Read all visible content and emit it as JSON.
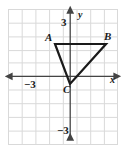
{
  "figure": {
    "type": "coordinate-grid-triangle",
    "background_color": "#ffffff",
    "grid_color": "#d9d9d9",
    "axis_color": "#555555",
    "shape_color": "#1a1a1a"
  },
  "axes": {
    "x_axis_label": "x",
    "y_axis_label": "y",
    "x_tick_label": "−3",
    "y_tick_label_positive": "3",
    "y_tick_label_negative": "−3",
    "x_range": [
      -4.8,
      3.7
    ],
    "y_range": [
      -5.3,
      5.2
    ],
    "grid_spacing": 1,
    "x_axis_pixel_y": 76,
    "y_axis_pixel_x": 70,
    "pixel_per_unit": 13.7
  },
  "triangle": {
    "vertices": [
      {
        "name": "A",
        "x": -1.1,
        "y": 2.35
      },
      {
        "name": "B",
        "x": 2.65,
        "y": 2.35
      },
      {
        "name": "C",
        "x": 0.0,
        "y": -0.6
      }
    ],
    "label_A": "A",
    "label_B": "B",
    "label_C": "C",
    "stroke_width": 2.2
  },
  "grid": {
    "left": 8,
    "top": 9,
    "right": 118,
    "bottom": 145,
    "cell_size": 13.7,
    "vertical_lines": [
      8,
      21.7,
      35.4,
      49.1,
      62.8,
      76.5,
      90.2,
      103.9,
      117.6
    ],
    "horizontal_lines": [
      9,
      22.7,
      36.4,
      50.1,
      63.8,
      77.5,
      91.2,
      104.9,
      118.6,
      132.3,
      145
    ]
  }
}
